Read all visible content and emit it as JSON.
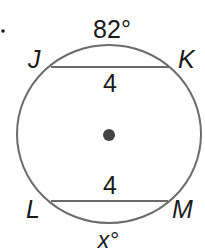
{
  "figure": {
    "bullet": "•",
    "arc_top_label": "82°",
    "arc_bottom_label": "x°",
    "points": {
      "J": "J",
      "K": "K",
      "L": "L",
      "M": "M"
    },
    "chord_top_length": "4",
    "chord_bottom_length": "4",
    "colors": {
      "stroke": "#6b6b6b",
      "text": "#1a1a1a",
      "center": "#444444"
    }
  }
}
